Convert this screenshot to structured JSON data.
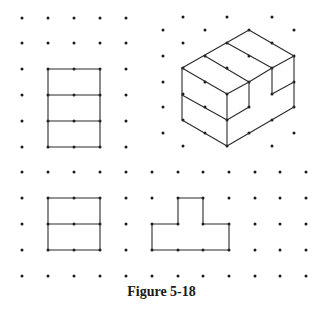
{
  "caption": "Figure 5-18",
  "colors": {
    "dot": "#1a1a1a",
    "line": "#2a2a2a",
    "background": "#ffffff"
  },
  "square_grid_top_left": {
    "xs": [
      22,
      48,
      74,
      100,
      126
    ],
    "ys": [
      18,
      43,
      69,
      95,
      121,
      147
    ]
  },
  "isometric_grid": {
    "even_columns": {
      "xs": [
        163,
        205,
        249,
        294
      ],
      "ys": [
        30,
        56,
        82,
        107,
        133
      ]
    },
    "odd_columns": {
      "xs": [
        183,
        227,
        272
      ],
      "ys": [
        17,
        43,
        68,
        94,
        120,
        146
      ]
    }
  },
  "square_grid_bottom": {
    "xs": [
      22,
      48,
      74,
      100,
      126,
      152,
      178,
      203,
      229,
      255,
      280,
      306
    ],
    "ys": [
      172,
      198,
      224,
      250,
      276
    ]
  },
  "figures": {
    "top_view": {
      "label": "top view (three stacked rectangles)",
      "polylines": [
        [
          [
            48,
            69
          ],
          [
            100,
            69
          ],
          [
            100,
            147
          ],
          [
            48,
            147
          ],
          [
            48,
            69
          ]
        ],
        [
          [
            48,
            95
          ],
          [
            100,
            95
          ]
        ],
        [
          [
            48,
            121
          ],
          [
            100,
            121
          ]
        ]
      ]
    },
    "isometric_solid": {
      "label": "isometric drawing of stepped solid with notch",
      "polylines": [
        [
          [
            182,
            68
          ],
          [
            249,
            30
          ],
          [
            294,
            56
          ]
        ],
        [
          [
            182,
            68
          ],
          [
            227,
            94
          ],
          [
            249,
            82
          ],
          [
            272,
            68
          ],
          [
            294,
            56
          ]
        ],
        [
          [
            205,
            56
          ],
          [
            249,
            82
          ]
        ],
        [
          [
            227,
            43
          ],
          [
            272,
            68
          ]
        ],
        [
          [
            272,
            68
          ],
          [
            272,
            94
          ],
          [
            294,
            82
          ]
        ],
        [
          [
            294,
            56
          ],
          [
            294,
            107
          ],
          [
            227,
            146
          ]
        ],
        [
          [
            249,
            82
          ],
          [
            249,
            107
          ],
          [
            227,
            120
          ]
        ],
        [
          [
            182,
            68
          ],
          [
            182,
            120
          ],
          [
            227,
            146
          ]
        ],
        [
          [
            182,
            95
          ],
          [
            227,
            120
          ]
        ],
        [
          [
            227,
            94
          ],
          [
            227,
            146
          ]
        ]
      ]
    },
    "front_view": {
      "label": "front view (two stacked rectangles)",
      "polylines": [
        [
          [
            48,
            198
          ],
          [
            100,
            198
          ],
          [
            100,
            250
          ],
          [
            48,
            250
          ],
          [
            48,
            198
          ]
        ],
        [
          [
            48,
            224
          ],
          [
            100,
            224
          ]
        ]
      ]
    },
    "side_view": {
      "label": "side view (T shape)",
      "polylines": [
        [
          [
            152,
            224
          ],
          [
            178,
            224
          ],
          [
            178,
            198
          ],
          [
            203,
            198
          ],
          [
            203,
            224
          ],
          [
            229,
            224
          ],
          [
            229,
            250
          ],
          [
            152,
            250
          ],
          [
            152,
            224
          ]
        ]
      ]
    }
  }
}
